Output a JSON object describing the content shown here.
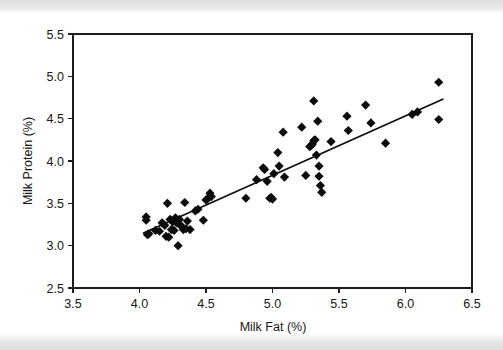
{
  "figure": {
    "background_color": "#ffffff",
    "ink_color": "#0b0b0b",
    "scan_band_color": "#dedcda"
  },
  "chart_data": {
    "type": "scatter",
    "title": "",
    "xlabel": "Milk Fat (%)",
    "ylabel": "Milk Protein (%)",
    "xlim": [
      3.5,
      6.5
    ],
    "ylim": [
      2.5,
      5.5
    ],
    "xticks": [
      "3.5",
      "4.0",
      "4.5",
      "5.0",
      "5.5",
      "6.0",
      "6.5"
    ],
    "yticks": [
      "2.5",
      "3.0",
      "3.5",
      "4.0",
      "4.5",
      "5.0",
      "5.5"
    ],
    "xtick_values": [
      3.5,
      4.0,
      4.5,
      5.0,
      5.5,
      6.0,
      6.5
    ],
    "ytick_values": [
      2.5,
      3.0,
      3.5,
      4.0,
      4.5,
      5.0,
      5.5
    ],
    "grid": false,
    "legend": null,
    "marker": "diamond",
    "marker_size": 4.6,
    "series": [
      {
        "name": "Milk samples",
        "points": [
          [
            4.05,
            3.34
          ],
          [
            4.05,
            3.3
          ],
          [
            4.06,
            3.13
          ],
          [
            4.07,
            3.14
          ],
          [
            4.12,
            3.18
          ],
          [
            4.15,
            3.17
          ],
          [
            4.17,
            3.27
          ],
          [
            4.19,
            3.24
          ],
          [
            4.2,
            3.11
          ],
          [
            4.21,
            3.5
          ],
          [
            4.22,
            3.1
          ],
          [
            4.23,
            3.31
          ],
          [
            4.24,
            3.19
          ],
          [
            4.25,
            3.28
          ],
          [
            4.26,
            3.18
          ],
          [
            4.27,
            3.33
          ],
          [
            4.28,
            3.27
          ],
          [
            4.29,
            3.0
          ],
          [
            4.3,
            3.31
          ],
          [
            4.3,
            3.25
          ],
          [
            4.31,
            3.24
          ],
          [
            4.33,
            3.19
          ],
          [
            4.34,
            3.51
          ],
          [
            4.35,
            3.2
          ],
          [
            4.36,
            3.29
          ],
          [
            4.38,
            3.19
          ],
          [
            4.42,
            3.41
          ],
          [
            4.44,
            3.43
          ],
          [
            4.48,
            3.3
          ],
          [
            4.5,
            3.54
          ],
          [
            4.51,
            3.55
          ],
          [
            4.53,
            3.62
          ],
          [
            4.54,
            3.58
          ],
          [
            4.8,
            3.56
          ],
          [
            4.88,
            3.78
          ],
          [
            4.93,
            3.92
          ],
          [
            4.94,
            3.9
          ],
          [
            4.96,
            3.76
          ],
          [
            4.98,
            3.56
          ],
          [
            4.99,
            3.57
          ],
          [
            5.0,
            3.55
          ],
          [
            5.01,
            3.85
          ],
          [
            5.04,
            4.1
          ],
          [
            5.05,
            3.94
          ],
          [
            5.08,
            4.34
          ],
          [
            5.09,
            3.81
          ],
          [
            5.22,
            4.4
          ],
          [
            5.25,
            3.83
          ],
          [
            5.28,
            4.17
          ],
          [
            5.29,
            4.18
          ],
          [
            5.3,
            4.2
          ],
          [
            5.31,
            4.71
          ],
          [
            5.31,
            4.24
          ],
          [
            5.32,
            4.25
          ],
          [
            5.33,
            4.07
          ],
          [
            5.34,
            4.47
          ],
          [
            5.35,
            3.94
          ],
          [
            5.35,
            3.82
          ],
          [
            5.36,
            3.71
          ],
          [
            5.37,
            3.63
          ],
          [
            5.44,
            4.23
          ],
          [
            5.56,
            4.53
          ],
          [
            5.57,
            4.36
          ],
          [
            5.7,
            4.66
          ],
          [
            5.74,
            4.45
          ],
          [
            5.85,
            4.21
          ],
          [
            6.05,
            4.55
          ],
          [
            6.09,
            4.58
          ],
          [
            6.25,
            4.93
          ],
          [
            6.25,
            4.49
          ]
        ]
      }
    ],
    "trendline": {
      "name": "least-squares fit",
      "x_start": 4.03,
      "y_start": 3.15,
      "x_end": 6.28,
      "y_end": 4.73
    }
  }
}
